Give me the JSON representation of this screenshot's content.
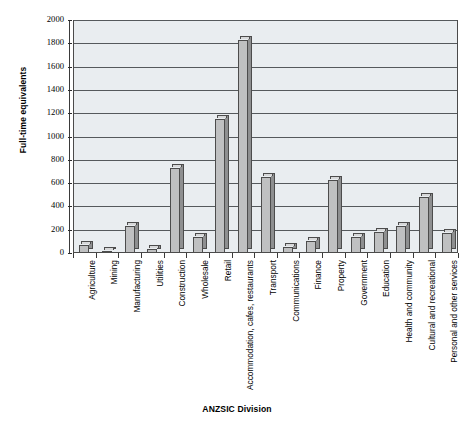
{
  "chart_data": {
    "type": "bar",
    "title": "",
    "xlabel": "ANZSIC Division",
    "ylabel": "Full-time equivalents",
    "ylim": [
      0,
      2000
    ],
    "ytick_step": 200,
    "yticks": [
      "2000",
      "1800",
      "1600",
      "1400",
      "1200",
      "1000",
      "800",
      "600",
      "400",
      "200",
      "0"
    ],
    "grid": true,
    "legend": "none",
    "plot_background": "#e9edf0",
    "bar_color": "#bfc0c1",
    "bar_side_color": "#8e8f90",
    "bar_outline_color": "#4c4c4c",
    "categories": [
      "Agriculture",
      "Mining",
      "Manufacturing",
      "Utilities",
      "Construction",
      "Wholesale",
      "Retail",
      "Accommodation, cafes, restaurants",
      "Transport",
      "Communications",
      "Finance",
      "Property",
      "Government",
      "Education",
      "Health and community",
      "Cultural and recreational",
      "Personal and other services"
    ],
    "values": [
      70,
      15,
      230,
      35,
      730,
      135,
      1150,
      1825,
      655,
      50,
      100,
      630,
      135,
      180,
      230,
      480,
      175
    ]
  },
  "axis": {
    "y_title": "Full-time equivalents",
    "x_title": "ANZSIC Division"
  }
}
